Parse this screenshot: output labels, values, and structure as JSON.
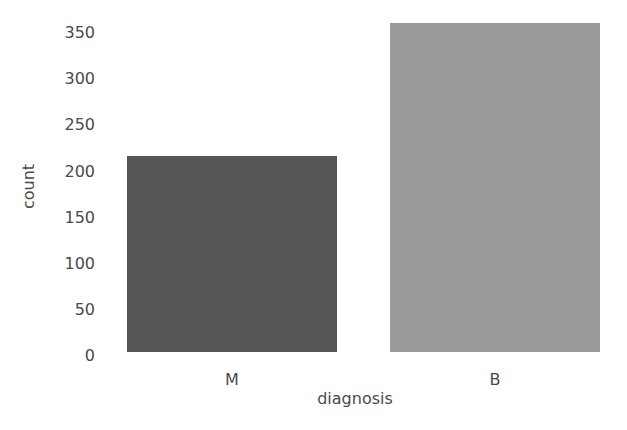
{
  "chart_data": {
    "type": "bar",
    "title": "",
    "xlabel": "diagnosis",
    "ylabel": "count",
    "categories": [
      "M",
      "B"
    ],
    "values": [
      212,
      357
    ],
    "colors": [
      "#555555",
      "#9a9a9a"
    ],
    "ylim": [
      0,
      360
    ],
    "yticks": [
      0,
      50,
      100,
      150,
      200,
      250,
      300,
      350
    ],
    "grid": false,
    "legend": null
  }
}
